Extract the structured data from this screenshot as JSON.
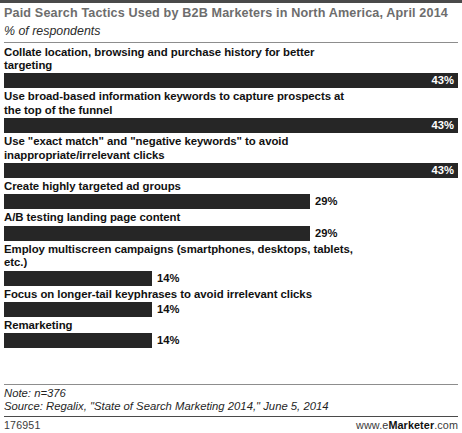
{
  "header": {
    "title": "Paid Search Tactics Used by B2B Marketers in North America, April 2014",
    "subtitle": "% of respondents"
  },
  "footer": {
    "note": "Note: n=376",
    "source": "Source: Regalix, \"State of Search Marketing 2014,\" June 5, 2014",
    "chart_id": "176951",
    "brand_prefix": "www.e",
    "brand_strong": "Marketer",
    "brand_suffix": ".com"
  },
  "chart_data": {
    "type": "bar",
    "orientation": "horizontal",
    "title": "Paid Search Tactics Used by B2B Marketers in North America, April 2014",
    "subtitle": "% of respondents",
    "xlabel": "",
    "ylabel": "",
    "xlim": [
      0,
      43
    ],
    "grid": false,
    "legend": false,
    "value_suffix": "%",
    "bar_color": "#262626",
    "categories": [
      "Collate location, browsing and purchase history for better targeting",
      "Use broad-based information keywords to capture prospects at the top of the funnel",
      "Use \"exact match\" and \"negative keywords\" to avoid inappropriate/irrelevant clicks",
      "Create highly targeted ad groups",
      "A/B testing landing page content",
      "Employ multiscreen campaigns (smartphones, desktops, tablets, etc.)",
      "Focus on longer-tail keyphrases to avoid irrelevant clicks",
      "Remarketing"
    ],
    "values": [
      43,
      43,
      43,
      29,
      29,
      14,
      14,
      14
    ],
    "value_labels": [
      "43%",
      "43%",
      "43%",
      "29%",
      "29%",
      "14%",
      "14%",
      "14%"
    ],
    "notes": "Note: n=376",
    "source": "Source: Regalix, \"State of Search Marketing 2014,\" June 5, 2014"
  },
  "bars": [
    {
      "label": "Collate location, browsing and purchase history for better\ntargeting",
      "value": 43,
      "value_label": "43%",
      "width_pct": 100,
      "label_inside": true
    },
    {
      "label": "Use broad-based information keywords to capture prospects at\nthe top of the funnel",
      "value": 43,
      "value_label": "43%",
      "width_pct": 100,
      "label_inside": true
    },
    {
      "label": "Use \"exact match\" and \"negative keywords\" to avoid\ninappropriate/irrelevant clicks",
      "value": 43,
      "value_label": "43%",
      "width_pct": 100,
      "label_inside": true
    },
    {
      "label": "Create highly targeted ad groups",
      "value": 29,
      "value_label": "29%",
      "width_pct": 67.4,
      "label_inside": false
    },
    {
      "label": "A/B testing landing page content",
      "value": 29,
      "value_label": "29%",
      "width_pct": 67.4,
      "label_inside": false
    },
    {
      "label": "Employ multiscreen campaigns (smartphones, desktops, tablets,\netc.)",
      "value": 14,
      "value_label": "14%",
      "width_pct": 32.6,
      "label_inside": false
    },
    {
      "label": "Focus on longer-tail keyphrases to avoid irrelevant clicks",
      "value": 14,
      "value_label": "14%",
      "width_pct": 32.6,
      "label_inside": false
    },
    {
      "label": "Remarketing",
      "value": 14,
      "value_label": "14%",
      "width_pct": 32.6,
      "label_inside": false
    }
  ]
}
